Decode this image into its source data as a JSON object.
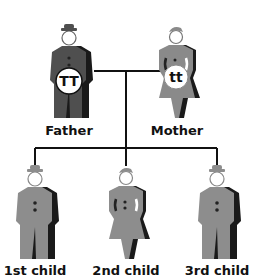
{
  "diagram": {
    "colors": {
      "father": "#4f4f4f",
      "mother": "#8a8a8a",
      "child": "#8d8d8d",
      "shadow": "#1a1a1a",
      "line": "#111111",
      "badge": "#ffffff"
    },
    "parents": [
      {
        "id": "father",
        "label": "Father",
        "genotype": "TT",
        "sex": "male"
      },
      {
        "id": "mother",
        "label": "Mother",
        "genotype": "tt",
        "sex": "female"
      }
    ],
    "children": [
      {
        "id": "child1",
        "label": "1st child",
        "sex": "male"
      },
      {
        "id": "child2",
        "label": "2nd child",
        "sex": "female"
      },
      {
        "id": "child3",
        "label": "3rd child",
        "sex": "male"
      }
    ]
  }
}
